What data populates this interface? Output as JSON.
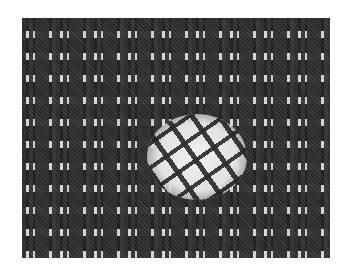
{
  "image": {
    "description": "Grayscale woven grid texture with a lighter circular inset containing a rotated copy of the grid pattern",
    "colors": {
      "background": "#ffffff",
      "texture_base": "#b8b8b8",
      "grid_lines": "#d8d8d8",
      "dark_blocks": "#1a1a1a",
      "patch_highlight": "#f0f0f0"
    },
    "texture_bounds": {
      "x": 22,
      "y": 18,
      "width": 308,
      "height": 240
    },
    "inset_patch": {
      "cx": 175,
      "cy": 139,
      "rotation_deg": -35
    }
  }
}
